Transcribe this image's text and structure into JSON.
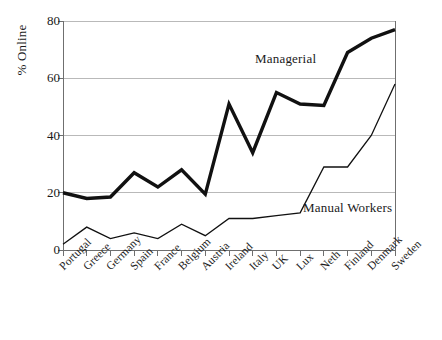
{
  "chart_data": {
    "type": "line",
    "title": "",
    "xlabel": "",
    "ylabel": "% Online",
    "ylim": [
      0,
      80
    ],
    "yticks": [
      0,
      20,
      40,
      60,
      80
    ],
    "grid": true,
    "legend_position": "inline-annotation",
    "categories": [
      "Portugal",
      "Greece",
      "Germany",
      "Spain",
      "France",
      "Belgium",
      "Austria",
      "Ireland",
      "Italy",
      "UK",
      "Lux",
      "Neth",
      "Finland",
      "Denmark",
      "Sweden"
    ],
    "series": [
      {
        "name": "Managerial",
        "values": [
          20,
          18,
          18.5,
          27,
          22,
          28,
          19.5,
          51,
          34,
          55,
          51,
          50.5,
          69,
          74,
          77
        ],
        "style": "thick-solid-black",
        "color": "#111111",
        "line_width": 3.4
      },
      {
        "name": "Manual Workers",
        "values": [
          2,
          8,
          4,
          6,
          4,
          9,
          5,
          11,
          11,
          12,
          13,
          29,
          29,
          40,
          58
        ],
        "style": "thin-solid-black",
        "color": "#111111",
        "line_width": 1.3
      }
    ],
    "annotations": [
      {
        "text": "Managerial",
        "series": "Managerial"
      },
      {
        "text": "Manual Workers",
        "series": "Manual Workers"
      }
    ],
    "colors": {
      "background": "#ffffff",
      "grid": "#b9b9b9",
      "axis": "#6f6f6f",
      "line": "#111111",
      "text": "#1a1a1a"
    }
  }
}
